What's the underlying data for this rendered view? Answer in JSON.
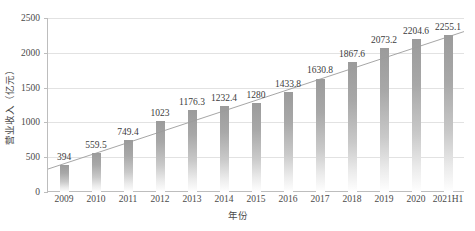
{
  "chart_data": {
    "type": "bar",
    "title": "",
    "xlabel": "年份",
    "ylabel": "营业收入（亿元）",
    "categories": [
      "2009",
      "2010",
      "2011",
      "2012",
      "2013",
      "2014",
      "2015",
      "2016",
      "2017",
      "2018",
      "2019",
      "2020",
      "2021H1"
    ],
    "values": [
      394,
      559.5,
      749.4,
      1023,
      1176.3,
      1232.4,
      1280,
      1433.8,
      1630.8,
      1867.6,
      2073.2,
      2204.6,
      2255.1
    ],
    "data_labels": [
      "394",
      "559.5",
      "749.4",
      "1023",
      "1176.3",
      "1232.4",
      "1280",
      "1433.8",
      "1630.8",
      "1867.6",
      "2073.2",
      "2204.6",
      "2255.1"
    ],
    "ylim": [
      0,
      2500
    ],
    "yticks": [
      0,
      500,
      1000,
      1500,
      2000,
      2500
    ],
    "ytick_labels": [
      "0",
      "500",
      "1000",
      "1500",
      "2000",
      "2500"
    ],
    "grid": true,
    "legend": "none",
    "series": [
      {
        "name": "营业收入",
        "values": [
          394,
          559.5,
          749.4,
          1023,
          1176.3,
          1232.4,
          1280,
          1433.8,
          1630.8,
          1867.6,
          2073.2,
          2204.6,
          2255.1
        ]
      }
    ],
    "annotations": [
      {
        "kind": "trendline",
        "style": "linear",
        "start_value": 330,
        "end_value": 2305,
        "color": "#9c9c9c"
      }
    ],
    "colors": {
      "bar_top": "#9b9b9b",
      "bar_bottom": "#ffffff",
      "gridline": "#e2e2e2",
      "axis": "#bdbdbd",
      "text": "#3c3c3c",
      "trendline": "#9c9c9c",
      "background": "#ffffff"
    }
  }
}
